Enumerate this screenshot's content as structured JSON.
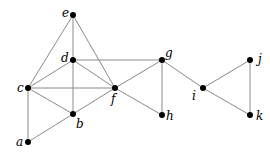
{
  "graph": {
    "nodes": [
      {
        "id": "e",
        "label": "e",
        "x": 73,
        "y": 15,
        "lx": 62,
        "ly": 17
      },
      {
        "id": "d",
        "label": "d",
        "x": 73,
        "y": 60,
        "lx": 61,
        "ly": 62
      },
      {
        "id": "c",
        "label": "c",
        "x": 28,
        "y": 88,
        "lx": 17,
        "ly": 92
      },
      {
        "id": "f",
        "label": "f",
        "x": 115,
        "y": 88,
        "lx": 111,
        "ly": 103
      },
      {
        "id": "b",
        "label": "b",
        "x": 73,
        "y": 114,
        "lx": 76,
        "ly": 128
      },
      {
        "id": "a",
        "label": "a",
        "x": 28,
        "y": 142,
        "lx": 16,
        "ly": 146
      },
      {
        "id": "g",
        "label": "g",
        "x": 162,
        "y": 60,
        "lx": 165,
        "ly": 57
      },
      {
        "id": "h",
        "label": "h",
        "x": 162,
        "y": 115,
        "lx": 166,
        "ly": 120
      },
      {
        "id": "i",
        "label": "i",
        "x": 203,
        "y": 88,
        "lx": 192,
        "ly": 100
      },
      {
        "id": "j",
        "label": "j",
        "x": 250,
        "y": 60,
        "lx": 258,
        "ly": 63
      },
      {
        "id": "k",
        "label": "k",
        "x": 250,
        "y": 115,
        "lx": 256,
        "ly": 120
      }
    ],
    "edges": [
      [
        "e",
        "c"
      ],
      [
        "e",
        "d"
      ],
      [
        "e",
        "f"
      ],
      [
        "d",
        "c"
      ],
      [
        "d",
        "f"
      ],
      [
        "d",
        "g"
      ],
      [
        "d",
        "b"
      ],
      [
        "c",
        "f"
      ],
      [
        "c",
        "b"
      ],
      [
        "c",
        "a"
      ],
      [
        "b",
        "f"
      ],
      [
        "a",
        "b"
      ],
      [
        "f",
        "g"
      ],
      [
        "f",
        "h"
      ],
      [
        "g",
        "h"
      ],
      [
        "g",
        "i"
      ],
      [
        "i",
        "j"
      ],
      [
        "i",
        "k"
      ],
      [
        "j",
        "k"
      ]
    ]
  }
}
